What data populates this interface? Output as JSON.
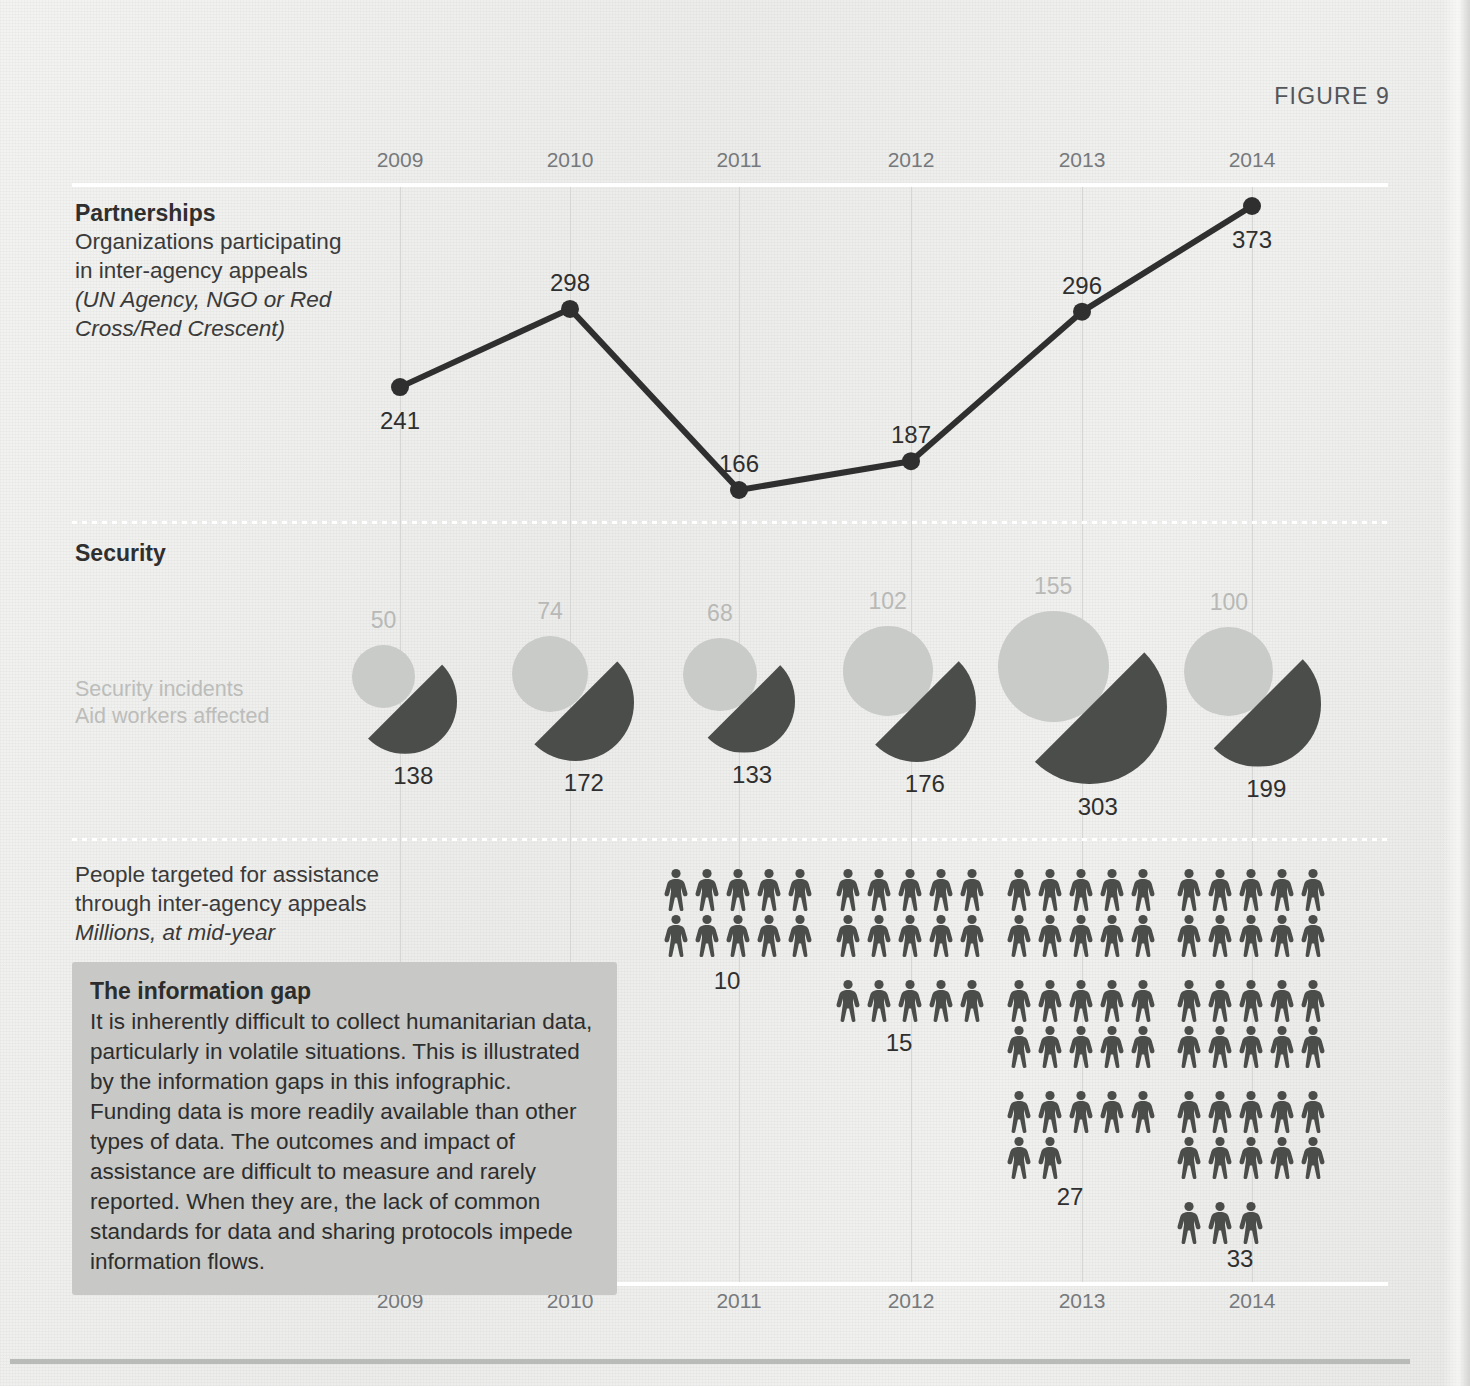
{
  "figure": {
    "label": "FIGURE 9"
  },
  "axis": {
    "years": [
      "2009",
      "2010",
      "2011",
      "2012",
      "2013",
      "2014"
    ]
  },
  "partnerships": {
    "title": "Partnerships",
    "line1": "Organizations participating",
    "line2": "in inter-agency appeals",
    "line3": "(UN Agency, NGO or Red",
    "line4": "Cross/Red Crescent)"
  },
  "security": {
    "title": "Security",
    "legend_line1": "Security incidents",
    "legend_line2": "Aid workers affected"
  },
  "people": {
    "line1": "People targeted for assistance",
    "line2": "through inter-agency appeals",
    "line3": "Millions, at mid-year"
  },
  "infobox": {
    "title": "The information gap",
    "body": "It is inherently difficult to collect humanitarian data, particularly in volatile situations. This is illustrated by the information gaps in this infographic. Funding data is more readily available than other types of data. The outcomes and impact of assistance are difficult to measure and rarely reported. When they are, the lack of common standards for data and sharing protocols impede information flows."
  },
  "colors": {
    "background": "#efefed",
    "dark": "#4a4d4a",
    "light": "#c9cbc8",
    "muted_text": "#b8b9b6",
    "gridline": "#d6d7d4",
    "infobox_bg": "#c8c9c6"
  },
  "chart_data": [
    {
      "type": "line",
      "title": "Partnerships",
      "subtitle": "Organizations participating in inter-agency appeals (UN Agency, NGO or Red Cross/Red Crescent)",
      "xlabel": "",
      "ylabel": "",
      "categories": [
        "2009",
        "2010",
        "2011",
        "2012",
        "2013",
        "2014"
      ],
      "values": [
        241,
        298,
        166,
        187,
        296,
        373
      ],
      "data_labels": [
        "241",
        "298",
        "166",
        "187",
        "296",
        "373"
      ],
      "grid": true,
      "legend": "none"
    },
    {
      "type": "bar",
      "title": "Security",
      "subtitle": "Security incidents / Aid workers affected",
      "categories": [
        "2009",
        "2010",
        "2011",
        "2012",
        "2013",
        "2014"
      ],
      "series": [
        {
          "name": "Security incidents",
          "values": [
            50,
            74,
            68,
            102,
            155,
            100
          ]
        },
        {
          "name": "Aid workers affected",
          "values": [
            138,
            172,
            133,
            176,
            303,
            199
          ]
        }
      ],
      "encoding": "paired-circles-area",
      "legend": "left"
    },
    {
      "type": "bar",
      "title": "People targeted for assistance through inter-agency appeals",
      "subtitle": "Millions, at mid-year",
      "categories": [
        "2009",
        "2010",
        "2011",
        "2012",
        "2013",
        "2014"
      ],
      "values": [
        null,
        null,
        10,
        15,
        27,
        33
      ],
      "data_labels": [
        "",
        "",
        "10",
        "15",
        "27",
        "33"
      ],
      "encoding": "pictogram",
      "unit": "1 icon = 1 million people",
      "legend": "none"
    }
  ],
  "pictogram": {
    "columns": [
      {
        "year": "2011",
        "count": 10,
        "label": "10"
      },
      {
        "year": "2012",
        "count": 15,
        "label": "15"
      },
      {
        "year": "2013",
        "count": 27,
        "label": "27"
      },
      {
        "year": "2014",
        "count": 33,
        "label": "33"
      }
    ]
  }
}
